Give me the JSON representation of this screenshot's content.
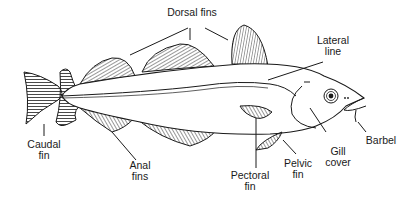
{
  "colors": {
    "ink": "#1a1a1a",
    "background": "#ffffff"
  },
  "labels": {
    "dorsal_fins": "Dorsal fins",
    "lateral_line": "Lateral\nline",
    "caudal_fin": "Caudal\nfin",
    "anal_fins": "Anal\nfins",
    "pectoral_fin": "Pectoral\nfin",
    "pelvic_fin": "Pelvic\nfin",
    "gill_cover": "Gill\ncover",
    "barbel": "Barbel"
  }
}
